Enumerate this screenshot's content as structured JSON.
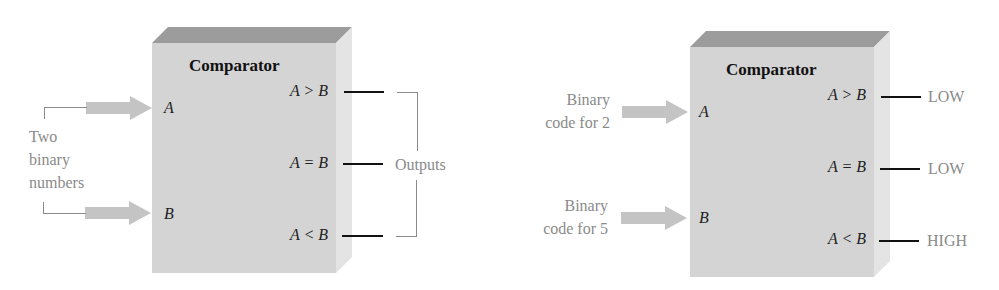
{
  "left_diagram": {
    "title": "Comparator",
    "inputs": [
      {
        "pin": "A"
      },
      {
        "pin": "B"
      }
    ],
    "input_annotation": [
      "Two",
      "binary",
      "numbers"
    ],
    "outputs": [
      {
        "label": "A > B"
      },
      {
        "label": "A = B"
      },
      {
        "label": "A < B"
      }
    ],
    "output_annotation": "Outputs"
  },
  "right_diagram": {
    "title": "Comparator",
    "inputs": [
      {
        "pin": "A",
        "annotation": [
          "Binary",
          "code for 2"
        ]
      },
      {
        "pin": "B",
        "annotation": [
          "Binary",
          "code for 5"
        ]
      }
    ],
    "outputs": [
      {
        "label": "A > B",
        "state": "LOW"
      },
      {
        "label": "A = B",
        "state": "LOW"
      },
      {
        "label": "A < B",
        "state": "HIGH"
      }
    ]
  },
  "colors": {
    "box_front": "#d4d4d4",
    "box_top": "#9c9c9c",
    "box_side": "#e4e4e4",
    "annotation_gray": "#8a8a8a",
    "arrow_fill": "#c4c4c4",
    "line_black": "#111111"
  }
}
